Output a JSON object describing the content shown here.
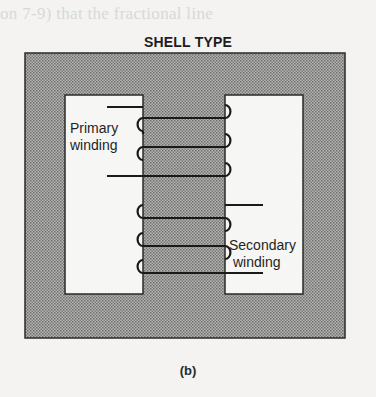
{
  "figure": {
    "background_bleed_text": "on 7-9) that the fractional line",
    "title": "SHELL TYPE",
    "caption": "(b)",
    "primary_label_line1": "Primary",
    "primary_label_line2": "winding",
    "secondary_label_line1": "Secondary",
    "secondary_label_line2": "winding",
    "colors": {
      "core_fill": "#9a9a98",
      "core_outline": "#2a2a2a",
      "window_fill": "#f6f6f4",
      "wire": "#1a1a1a",
      "page": "#f4f3f1"
    }
  }
}
